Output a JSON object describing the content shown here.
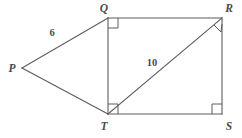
{
  "figure": {
    "background_color": "#ffffff",
    "stroke_color": "#5d5d5d",
    "label_color": "#4a4a4a"
  },
  "vertices": [
    {
      "name": "P",
      "label": "P",
      "x": 22,
      "y": 68,
      "label_x": 12,
      "label_y": 72
    },
    {
      "name": "Q",
      "label": "Q",
      "x": 108,
      "y": 18,
      "label_x": 104,
      "label_y": 12
    },
    {
      "name": "R",
      "label": "R",
      "x": 222,
      "y": 18,
      "label_x": 227,
      "label_y": 12
    },
    {
      "name": "S",
      "label": "S",
      "x": 222,
      "y": 114,
      "label_x": 227,
      "label_y": 128
    },
    {
      "name": "T",
      "label": "T",
      "x": 108,
      "y": 114,
      "label_x": 104,
      "label_y": 128
    }
  ],
  "edges": [
    {
      "name": "segment-PQ",
      "from": "P",
      "to": "Q"
    },
    {
      "name": "segment-PT",
      "from": "P",
      "to": "T"
    },
    {
      "name": "segment-QR",
      "from": "Q",
      "to": "R"
    },
    {
      "name": "segment-RS",
      "from": "R",
      "to": "S"
    },
    {
      "name": "segment-ST",
      "from": "S",
      "to": "T"
    },
    {
      "name": "segment-QT",
      "from": "Q",
      "to": "T"
    },
    {
      "name": "segment-TR",
      "from": "T",
      "to": "R"
    }
  ],
  "right_angles": [
    {
      "name": "right-angle-Q",
      "at": "Q",
      "orientation": "axis-aligned",
      "opens": "down-right"
    },
    {
      "name": "right-angle-R",
      "at": "R",
      "orientation": "rotated",
      "opens": "toward-T-and-S"
    },
    {
      "name": "right-angle-S",
      "at": "S",
      "orientation": "axis-aligned",
      "opens": "up-left"
    },
    {
      "name": "right-angle-T",
      "at": "T",
      "orientation": "axis-aligned",
      "opens": "up-right"
    }
  ],
  "measures": [
    {
      "name": "length-PQ",
      "value": "6",
      "segment": "PQ",
      "x": 52,
      "y": 36
    },
    {
      "name": "length-TR",
      "value": "10",
      "segment": "TR",
      "x": 152,
      "y": 66
    }
  ]
}
